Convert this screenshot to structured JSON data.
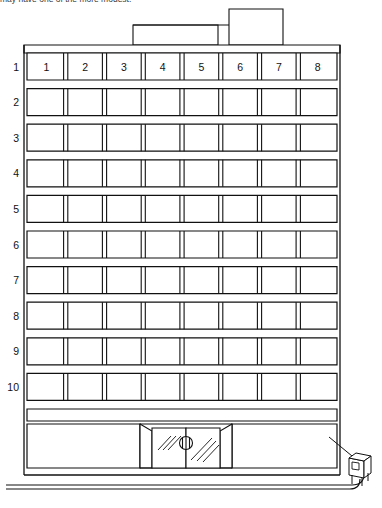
{
  "drawing": {
    "title_caption": "may have one of the more modest.",
    "type": "architectural-elevation",
    "subject": "ten-story office building front elevation",
    "line_color": "#111111",
    "background_color": "#ffffff"
  },
  "bays": {
    "label_axis": "window-bay-numbers-top-row",
    "count": 8,
    "labels": [
      "1",
      "2",
      "3",
      "4",
      "5",
      "6",
      "7",
      "8"
    ]
  },
  "floors": {
    "label_axis": "floor-numbers-left-margin",
    "count": 10,
    "labels": [
      "1",
      "2",
      "3",
      "4",
      "5",
      "6",
      "7",
      "8",
      "9",
      "10"
    ]
  },
  "roof": {
    "structures": [
      {
        "name": "penthouse-low",
        "label": ""
      },
      {
        "name": "penthouse-tall",
        "label": ""
      }
    ]
  },
  "ground_floor": {
    "entrance": {
      "name": "glass-double-door",
      "label": "",
      "has_handle": true,
      "reflection_marks": 4
    },
    "storefront_left": "",
    "storefront_right": ""
  },
  "site": {
    "street_lines": 2,
    "mailbox": {
      "name": "mailbox",
      "label": ""
    }
  }
}
